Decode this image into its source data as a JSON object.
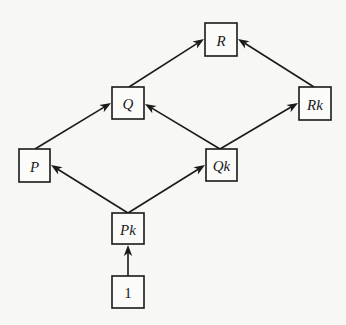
{
  "diagram": {
    "type": "hasse-diagram",
    "nodes": [
      {
        "id": "R",
        "label": "R",
        "italic": true
      },
      {
        "id": "Q",
        "label": "Q",
        "italic": true
      },
      {
        "id": "Rk",
        "label": "Rk",
        "italic": true
      },
      {
        "id": "P",
        "label": "P",
        "italic": true
      },
      {
        "id": "Qk",
        "label": "Qk",
        "italic": true
      },
      {
        "id": "Pk",
        "label": "Pk",
        "italic": true
      },
      {
        "id": "1",
        "label": "1",
        "italic": false
      }
    ],
    "edges": [
      {
        "from": "1",
        "to": "Pk"
      },
      {
        "from": "Pk",
        "to": "P"
      },
      {
        "from": "Pk",
        "to": "Qk"
      },
      {
        "from": "P",
        "to": "Q"
      },
      {
        "from": "Qk",
        "to": "Q"
      },
      {
        "from": "Qk",
        "to": "Rk"
      },
      {
        "from": "Q",
        "to": "R"
      },
      {
        "from": "Rk",
        "to": "R"
      }
    ],
    "colors": {
      "stroke": "#1a1a1a",
      "background": "#f7f7f5"
    }
  }
}
